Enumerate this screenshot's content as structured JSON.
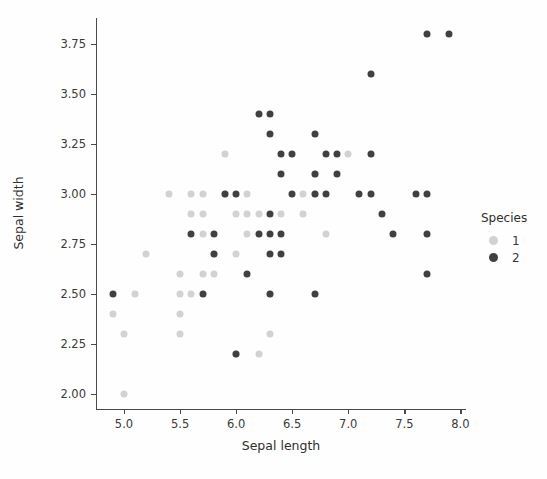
{
  "chart_data": {
    "type": "scatter",
    "title": "",
    "xlabel": "Sepal length",
    "ylabel": "Sepal width",
    "xlim": [
      4.75,
      8.05
    ],
    "ylim": [
      1.92,
      3.88
    ],
    "xticks": [
      "5.0",
      "5.5",
      "6.0",
      "6.5",
      "7.0",
      "7.5",
      "8.0"
    ],
    "xtick_values": [
      5.0,
      5.5,
      6.0,
      6.5,
      7.0,
      7.5,
      8.0
    ],
    "yticks": [
      "2.00",
      "2.25",
      "2.50",
      "2.75",
      "3.00",
      "3.25",
      "3.50",
      "3.75"
    ],
    "ytick_values": [
      2.0,
      2.25,
      2.5,
      2.75,
      3.0,
      3.25,
      3.5,
      3.75
    ],
    "grid": false,
    "legend": {
      "title": "Species",
      "position": "right",
      "entries": [
        {
          "label": "1",
          "color": "#d2d2d2"
        },
        {
          "label": "2",
          "color": "#404040"
        }
      ]
    },
    "marker_size": 7,
    "series": [
      {
        "name": "1",
        "color": "#d2d2d2",
        "points": [
          [
            4.9,
            2.4
          ],
          [
            5.0,
            2.0
          ],
          [
            5.0,
            2.3
          ],
          [
            5.1,
            2.5
          ],
          [
            5.2,
            2.7
          ],
          [
            5.4,
            3.0
          ],
          [
            5.5,
            2.3
          ],
          [
            5.5,
            2.4
          ],
          [
            5.5,
            2.5
          ],
          [
            5.5,
            2.6
          ],
          [
            5.6,
            2.5
          ],
          [
            5.6,
            2.9
          ],
          [
            5.6,
            3.0
          ],
          [
            5.7,
            2.6
          ],
          [
            5.7,
            2.8
          ],
          [
            5.7,
            2.9
          ],
          [
            5.7,
            3.0
          ],
          [
            5.8,
            2.6
          ],
          [
            5.8,
            2.7
          ],
          [
            5.9,
            3.0
          ],
          [
            5.9,
            3.2
          ],
          [
            6.0,
            2.2
          ],
          [
            6.0,
            2.7
          ],
          [
            6.0,
            2.9
          ],
          [
            6.1,
            2.8
          ],
          [
            6.1,
            2.9
          ],
          [
            6.1,
            3.0
          ],
          [
            6.2,
            2.2
          ],
          [
            6.2,
            2.9
          ],
          [
            6.3,
            2.3
          ],
          [
            6.3,
            2.5
          ],
          [
            6.4,
            2.9
          ],
          [
            6.6,
            2.9
          ],
          [
            6.6,
            3.0
          ],
          [
            6.7,
            3.0
          ],
          [
            6.7,
            3.1
          ],
          [
            6.8,
            2.8
          ],
          [
            7.0,
            3.2
          ]
        ]
      },
      {
        "name": "2",
        "color": "#404040",
        "points": [
          [
            4.9,
            2.5
          ],
          [
            5.6,
            2.8
          ],
          [
            5.7,
            2.5
          ],
          [
            5.8,
            2.7
          ],
          [
            5.8,
            2.8
          ],
          [
            5.9,
            3.0
          ],
          [
            6.0,
            2.2
          ],
          [
            6.0,
            3.0
          ],
          [
            6.1,
            2.6
          ],
          [
            6.2,
            2.8
          ],
          [
            6.2,
            3.4
          ],
          [
            6.3,
            2.5
          ],
          [
            6.3,
            2.7
          ],
          [
            6.3,
            2.8
          ],
          [
            6.3,
            2.9
          ],
          [
            6.3,
            3.3
          ],
          [
            6.3,
            3.4
          ],
          [
            6.4,
            2.7
          ],
          [
            6.4,
            2.8
          ],
          [
            6.4,
            3.1
          ],
          [
            6.4,
            3.2
          ],
          [
            6.5,
            3.0
          ],
          [
            6.5,
            3.2
          ],
          [
            6.7,
            2.5
          ],
          [
            6.7,
            3.0
          ],
          [
            6.7,
            3.1
          ],
          [
            6.7,
            3.3
          ],
          [
            6.8,
            3.0
          ],
          [
            6.8,
            3.2
          ],
          [
            6.9,
            3.1
          ],
          [
            6.9,
            3.2
          ],
          [
            7.1,
            3.0
          ],
          [
            7.2,
            3.0
          ],
          [
            7.2,
            3.2
          ],
          [
            7.2,
            3.6
          ],
          [
            7.3,
            2.9
          ],
          [
            7.4,
            2.8
          ],
          [
            7.6,
            3.0
          ],
          [
            7.7,
            2.6
          ],
          [
            7.7,
            2.8
          ],
          [
            7.7,
            3.0
          ],
          [
            7.7,
            3.8
          ],
          [
            7.9,
            3.8
          ]
        ]
      }
    ]
  }
}
